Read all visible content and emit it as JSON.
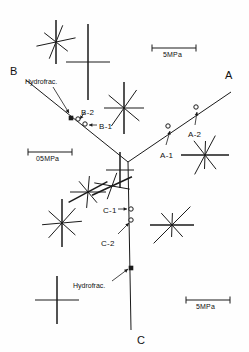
{
  "figure": {
    "kind": "in-situ stress measurement site map",
    "background": "#fefefe",
    "ink": "#1a1a1a"
  },
  "branch_labels": [
    {
      "id": "A",
      "text": "A",
      "x": 225,
      "y": 70
    },
    {
      "id": "B",
      "text": "B",
      "x": 10,
      "y": 66
    },
    {
      "id": "C",
      "text": "C",
      "x": 137,
      "y": 335
    }
  ],
  "galleries": [
    {
      "name": "gallery-b",
      "from": [
        26,
        80
      ],
      "to": [
        128,
        162
      ]
    },
    {
      "name": "gallery-a",
      "from": [
        128,
        162
      ],
      "to": [
        231,
        92
      ]
    },
    {
      "name": "gallery-c",
      "from": [
        128,
        162
      ],
      "to": [
        131,
        330
      ]
    }
  ],
  "stations": [
    {
      "id": "A-1",
      "label": "A-1",
      "marker": "open",
      "mx": 168,
      "my": 126,
      "lx": 160,
      "ly": 152,
      "ax1": 166,
      "ay1": 145,
      "ax2": 170,
      "ay2": 131
    },
    {
      "id": "A-2",
      "label": "A-2",
      "marker": "open",
      "mx": 196,
      "my": 107,
      "lx": 188,
      "ly": 131,
      "ax1": 195,
      "ay1": 125,
      "ax2": 197,
      "ay2": 112
    },
    {
      "id": "B-1",
      "label": "B-1",
      "marker": "open",
      "mx": 85,
      "my": 124,
      "lx": 99,
      "ly": 123,
      "ax1": 97,
      "ay1": 125,
      "ax2": 89,
      "ay2": 125
    },
    {
      "id": "B-2",
      "label": "B-2",
      "marker": "open",
      "mx": 78,
      "my": 119,
      "lx": 81,
      "ly": 109,
      "ax1": 85,
      "ay1": 112,
      "ax2": 80,
      "ay2": 119
    },
    {
      "id": "C-1",
      "label": "C-1",
      "marker": "open",
      "mx": 131,
      "my": 209,
      "lx": 103,
      "ly": 207,
      "ax1": 118,
      "ay1": 209,
      "ax2": 127,
      "ay2": 209
    },
    {
      "id": "C-2",
      "label": "C-2",
      "marker": "open",
      "mx": 131,
      "my": 220,
      "lx": 101,
      "ly": 240,
      "ax1": 118,
      "ay1": 234,
      "ax2": 129,
      "ay2": 223
    }
  ],
  "hydrofrac": [
    {
      "id": "hydrofrac-b",
      "label": "Hydrofrac.",
      "marker": "filled",
      "mx": 71,
      "my": 118,
      "lx": 25,
      "ly": 78,
      "ax1": 53,
      "ay1": 87,
      "ax2": 69,
      "ay2": 113
    },
    {
      "id": "hydrofrac-c",
      "label": "Hydrofrac.",
      "marker": "filled",
      "mx": 131,
      "my": 268,
      "lx": 73,
      "ly": 282,
      "ax1": 112,
      "ay1": 281,
      "ax2": 128,
      "ay2": 269
    }
  ],
  "scale_bars": [
    {
      "id": "scale-top-right",
      "label": "5MPa",
      "x1": 152,
      "y1": 48,
      "x2": 196,
      "y2": 48,
      "tx": 163,
      "ty": 51
    },
    {
      "id": "scale-mid-left",
      "label": "05MPa",
      "x1": 28,
      "y1": 152,
      "x2": 72,
      "y2": 152,
      "tx": 36,
      "ty": 155
    },
    {
      "id": "scale-bottom-right",
      "label": "5MPa",
      "x1": 186,
      "y1": 300,
      "x2": 230,
      "y2": 300,
      "tx": 196,
      "ty": 303
    }
  ],
  "stress_symbols": [
    {
      "id": "sym-1",
      "cx": 56,
      "cy": 42,
      "rays": [
        [
          90,
          22
        ],
        [
          12,
          20
        ],
        [
          68,
          18
        ],
        [
          -38,
          15
        ]
      ]
    },
    {
      "id": "sym-2",
      "cx": 88,
      "cy": 62,
      "rays": [
        [
          90,
          38
        ],
        [
          0,
          22
        ]
      ]
    },
    {
      "id": "sym-3",
      "cx": 124,
      "cy": 108,
      "rays": [
        [
          90,
          26
        ],
        [
          0,
          20
        ],
        [
          55,
          22
        ],
        [
          -40,
          20
        ]
      ]
    },
    {
      "id": "sym-4",
      "cx": 88,
      "cy": 192,
      "rays": [
        [
          28,
          22
        ],
        [
          0,
          18
        ],
        [
          85,
          16
        ],
        [
          -50,
          14
        ]
      ]
    },
    {
      "id": "sym-5",
      "cx": 62,
      "cy": 223,
      "rays": [
        [
          90,
          24
        ],
        [
          5,
          20
        ],
        [
          48,
          20
        ],
        [
          -42,
          18
        ]
      ]
    },
    {
      "id": "sym-6",
      "cx": 57,
      "cy": 300,
      "rays": [
        [
          90,
          24
        ],
        [
          0,
          22
        ]
      ]
    },
    {
      "id": "sym-7",
      "cx": 205,
      "cy": 155,
      "rays": [
        [
          0,
          24
        ],
        [
          62,
          22
        ],
        [
          -52,
          18
        ],
        [
          88,
          14
        ]
      ]
    },
    {
      "id": "sym-8",
      "cx": 172,
      "cy": 225,
      "rays": [
        [
          0,
          22
        ],
        [
          45,
          26
        ],
        [
          -48,
          16
        ],
        [
          88,
          12
        ]
      ]
    },
    {
      "id": "sym-9",
      "cx": 112,
      "cy": 186,
      "rays": [
        [
          25,
          22
        ],
        [
          -10,
          18
        ],
        [
          70,
          14
        ]
      ]
    },
    {
      "id": "sym-10",
      "cx": 120,
      "cy": 170,
      "rays": [
        [
          90,
          18
        ],
        [
          0,
          14
        ]
      ]
    }
  ]
}
